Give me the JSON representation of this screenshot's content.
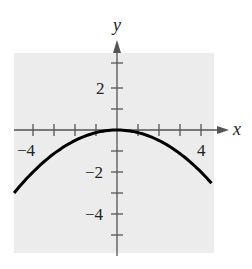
{
  "chart_data": {
    "type": "line",
    "title": "",
    "xlabel": "x",
    "ylabel": "y",
    "xlim": [
      -4.9,
      4.6
    ],
    "ylim": [
      -5.9,
      3.7
    ],
    "x_ticks": [
      -4,
      -3,
      -2,
      -1,
      1,
      2,
      3,
      4
    ],
    "y_ticks": [
      3,
      2,
      1,
      -1,
      -2,
      -3,
      -4,
      -5
    ],
    "x_tick_labels": [
      "-4",
      "4"
    ],
    "y_tick_labels": [
      "2",
      "-2",
      "-4"
    ],
    "grid": false,
    "background": "#ececec",
    "series": [
      {
        "name": "y = -x^2/8",
        "x": [
          -4.9,
          -4,
          -3,
          -2,
          -1,
          0,
          1,
          2,
          3,
          4,
          4.5
        ],
        "values": [
          -3.0,
          -2.0,
          -1.125,
          -0.5,
          -0.125,
          0,
          -0.125,
          -0.5,
          -1.125,
          -2.0,
          -2.53
        ],
        "color": "#000000"
      }
    ]
  },
  "labels": {
    "x_axis": "x",
    "y_axis": "y",
    "xneg4": "−4",
    "xpos4": "4",
    "ypos2": "2",
    "yneg2": "−2",
    "yneg4": "−4"
  }
}
